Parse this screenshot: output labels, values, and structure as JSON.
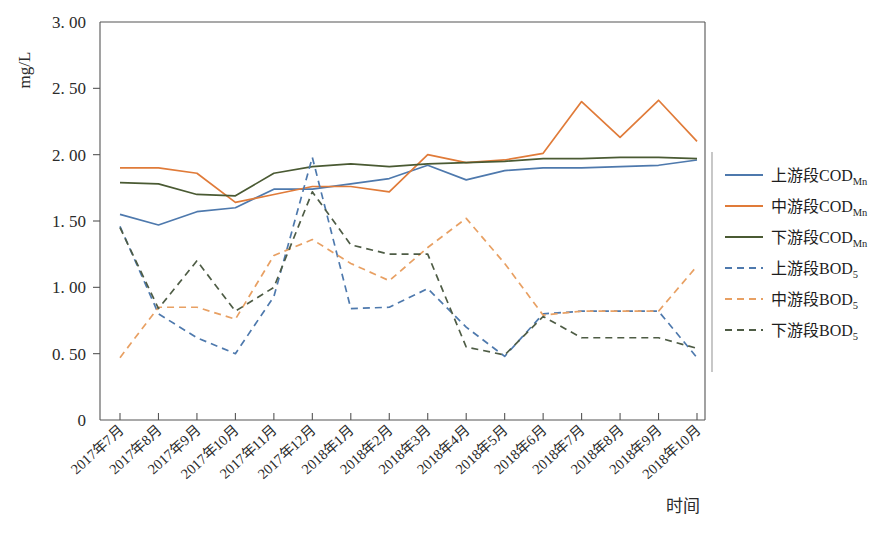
{
  "chart_data": {
    "type": "line",
    "title": "",
    "xlabel": "时间",
    "ylabel": "mg/L",
    "ylim": [
      0,
      3.0
    ],
    "ytick_labels": [
      "0",
      "0. 50",
      "1. 00",
      "1. 50",
      "2. 00",
      "2. 50",
      "3. 00"
    ],
    "ytick_values": [
      0,
      0.5,
      1.0,
      1.5,
      2.0,
      2.5,
      3.0
    ],
    "grid": false,
    "legend_position": "right",
    "categories": [
      "2017年7月",
      "2017年8月",
      "2017年9月",
      "2017年10月",
      "2017年11月",
      "2017年12月",
      "2018年1月",
      "2018年2月",
      "2018年3月",
      "2018年4月",
      "2018年5月",
      "2018年6月",
      "2018年7月",
      "2018年8月",
      "2018年9月",
      "2018年10月"
    ],
    "series": [
      {
        "name": "上游段COD",
        "name_prefix": "上游段COD",
        "name_sub": "Mn",
        "color": "#4e79ad",
        "dash": "solid",
        "values": [
          1.55,
          1.47,
          1.57,
          1.6,
          1.74,
          1.74,
          1.78,
          1.82,
          1.92,
          1.81,
          1.88,
          1.9,
          1.9,
          1.91,
          1.92,
          1.96
        ]
      },
      {
        "name": "中游段COD",
        "name_prefix": "中游段COD",
        "name_sub": "Mn",
        "color": "#e07b39",
        "dash": "solid",
        "values": [
          1.9,
          1.9,
          1.86,
          1.64,
          1.7,
          1.76,
          1.76,
          1.72,
          2.0,
          1.94,
          1.96,
          2.01,
          2.4,
          2.13,
          2.41,
          2.1
        ]
      },
      {
        "name": "下游段COD",
        "name_prefix": "下游段COD",
        "name_sub": "Mn",
        "color": "#4a5a33",
        "dash": "solid",
        "values": [
          1.79,
          1.78,
          1.7,
          1.69,
          1.86,
          1.91,
          1.93,
          1.91,
          1.93,
          1.94,
          1.95,
          1.97,
          1.97,
          1.98,
          1.98,
          1.97
        ]
      },
      {
        "name": "上游段BOD",
        "name_prefix": "上游段BOD",
        "name_sub": "5",
        "color": "#4e79ad",
        "dash": "dashed",
        "values": [
          1.46,
          0.8,
          0.62,
          0.5,
          0.93,
          1.98,
          0.84,
          0.85,
          0.99,
          0.7,
          0.48,
          0.8,
          0.82,
          0.82,
          0.82,
          0.47
        ]
      },
      {
        "name": "中游段BOD",
        "name_prefix": "中游段BOD",
        "name_sub": "5",
        "color": "#e8a063",
        "dash": "dashed",
        "values": [
          0.47,
          0.85,
          0.85,
          0.76,
          1.24,
          1.36,
          1.18,
          1.05,
          1.3,
          1.52,
          1.18,
          0.79,
          0.82,
          0.82,
          0.82,
          1.16
        ]
      },
      {
        "name": "下游段BOD",
        "name_prefix": "下游段BOD",
        "name_sub": "5",
        "color": "#4e5c45",
        "dash": "dashed",
        "values": [
          1.45,
          0.84,
          1.2,
          0.82,
          1.0,
          1.72,
          1.32,
          1.25,
          1.25,
          0.55,
          0.49,
          0.78,
          0.62,
          0.62,
          0.62,
          0.54
        ]
      }
    ]
  },
  "legend": {
    "items": [
      {
        "label_prefix": "上游段COD",
        "label_sub": "Mn"
      },
      {
        "label_prefix": "中游段COD",
        "label_sub": "Mn"
      },
      {
        "label_prefix": "下游段COD",
        "label_sub": "Mn"
      },
      {
        "label_prefix": "上游段BOD",
        "label_sub": "5"
      },
      {
        "label_prefix": "中游段BOD",
        "label_sub": "5"
      },
      {
        "label_prefix": "下游段BOD",
        "label_sub": "5"
      }
    ]
  }
}
